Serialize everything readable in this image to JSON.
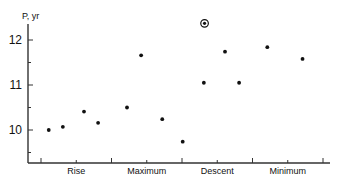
{
  "chart_data": {
    "type": "scatter",
    "title": "",
    "xlabel": "",
    "ylabel": "P, yr",
    "ylim": [
      9.3,
      12.4
    ],
    "yticks": [
      {
        "value": 12,
        "label": "12",
        "major": true
      },
      {
        "value": 11.5,
        "label": "",
        "major": false
      },
      {
        "value": 11,
        "label": "11",
        "major": true
      },
      {
        "value": 10.5,
        "label": "",
        "major": false
      },
      {
        "value": 10,
        "label": "10",
        "major": true
      },
      {
        "value": 9.5,
        "label": "",
        "major": false
      }
    ],
    "categories": [
      "Rise",
      "Maximum",
      "Descent",
      "Minimum"
    ],
    "grid": false,
    "legend": null,
    "series": [
      {
        "name": "Rise",
        "points": [
          {
            "xpos": 0.11,
            "y": 10.0
          },
          {
            "xpos": 0.31,
            "y": 10.07
          },
          {
            "xpos": 0.61,
            "y": 10.41
          },
          {
            "xpos": 0.81,
            "y": 10.16
          }
        ]
      },
      {
        "name": "Maximum",
        "points": [
          {
            "xpos": 0.22,
            "y": 10.5
          },
          {
            "xpos": 0.42,
            "y": 11.66
          },
          {
            "xpos": 0.72,
            "y": 10.24
          },
          {
            "xpos": 1.01,
            "y": 9.74
          }
        ]
      },
      {
        "name": "Descent",
        "points": [
          {
            "xpos": 0.31,
            "y": 11.05
          },
          {
            "xpos": 0.61,
            "y": 11.74
          },
          {
            "xpos": 0.81,
            "y": 11.05
          },
          {
            "xpos": 0.32,
            "y": 12.37,
            "marker": "circled"
          }
        ]
      },
      {
        "name": "Minimum",
        "points": [
          {
            "xpos": 0.21,
            "y": 11.84
          },
          {
            "xpos": 0.71,
            "y": 11.58
          }
        ]
      }
    ],
    "annotations": [
      {
        "text": "circled point (special marker)",
        "category": "Descent",
        "y": 12.37
      }
    ]
  },
  "axis": {
    "ylabel": "P, yr",
    "ytick_labels": [
      "12",
      "11",
      "10"
    ],
    "categories": [
      "Rise",
      "Maximum",
      "Descent",
      "Minimum"
    ]
  }
}
